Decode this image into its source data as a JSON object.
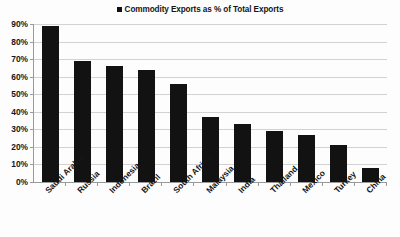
{
  "legend": {
    "marker_name": "legend-color-swatch",
    "label": "Commodity Exports as % of Total Exports",
    "series_color": "#121212"
  },
  "axes": {
    "y_ticks": [
      "90%",
      "80%",
      "70%",
      "60%",
      "50%",
      "40%",
      "30%",
      "20%",
      "10%",
      "0%"
    ]
  },
  "chart_data": {
    "type": "bar",
    "title": "",
    "subtitle": "",
    "xlabel": "",
    "ylabel": "",
    "ylim": [
      0,
      90
    ],
    "ytick_values": [
      0,
      10,
      20,
      30,
      40,
      50,
      60,
      70,
      80,
      90
    ],
    "ytick_labels": [
      "0%",
      "10%",
      "20%",
      "30%",
      "40%",
      "50%",
      "60%",
      "70%",
      "80%",
      "90%"
    ],
    "grid": true,
    "legend_position": "top-center",
    "legend_entries": [
      "Commodity Exports as % of Total Exports"
    ],
    "bar_color": "#121212",
    "categories": [
      "Saudi Arabia",
      "Russia",
      "Indonesia",
      "Brazil",
      "South Africa",
      "Malaysia",
      "India",
      "Thailand",
      "Mexico",
      "Turkey",
      "China"
    ],
    "values": [
      89,
      69,
      66,
      64,
      56,
      37,
      33,
      29,
      27,
      21,
      8
    ],
    "series": [
      {
        "name": "Commodity Exports as % of Total Exports",
        "values": [
          89,
          69,
          66,
          64,
          56,
          37,
          33,
          29,
          27,
          21,
          8
        ]
      }
    ],
    "units": "percent"
  }
}
